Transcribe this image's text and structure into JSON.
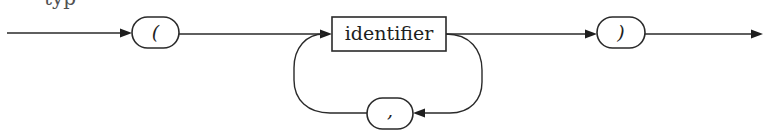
{
  "diagram": {
    "type": "syntax-railroad-diagram",
    "cropped_text_fragment": "typ",
    "nodes": [
      {
        "id": "open-paren",
        "kind": "terminal",
        "shape": "rounded-oval",
        "label": "("
      },
      {
        "id": "identifier",
        "kind": "nonterminal",
        "shape": "rectangle",
        "label": "identifier"
      },
      {
        "id": "comma",
        "kind": "terminal",
        "shape": "rounded-oval",
        "label": ","
      },
      {
        "id": "close-paren",
        "kind": "terminal",
        "shape": "rounded-oval",
        "label": ")"
      }
    ],
    "edges": [
      {
        "from": "entry",
        "to": "open-paren"
      },
      {
        "from": "open-paren",
        "to": "identifier"
      },
      {
        "from": "identifier",
        "to": "close-paren"
      },
      {
        "from": "identifier",
        "to": "comma",
        "note": "repeat loop (right side, going down)"
      },
      {
        "from": "comma",
        "to": "identifier",
        "note": "repeat loop (left side, going up)"
      },
      {
        "from": "close-paren",
        "to": "exit"
      }
    ],
    "colors": {
      "stroke": "#2a2a2a",
      "background": "#ffffff"
    }
  }
}
